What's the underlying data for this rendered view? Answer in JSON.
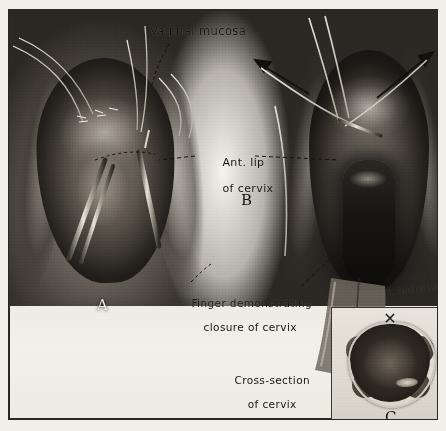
{
  "plate": {
    "title": "Surgical plate: vaginal cervix closure",
    "medium": "halftone photographic illustration",
    "border_color": "#2a2722",
    "paper_color": "#f2efe8"
  },
  "labels": {
    "vaginal_mucosa": "Vaginal mucosa",
    "ant_lip_line1": "Ant. lip",
    "ant_lip_line2": "of cervix",
    "finger_line1": "Finger demonstrating",
    "finger_line2": "closure of cervix",
    "cross_line1": "Cross-section",
    "cross_line2": "of cervix",
    "cross_line3": "demonstrating",
    "cross_line4": "ligature"
  },
  "panels": [
    {
      "letter": "A",
      "name": "panel-a",
      "description": "Left operative field with sutures and clamps"
    },
    {
      "letter": "B",
      "name": "panel-b",
      "description": "Right operative field with traction arrows and finger closure"
    },
    {
      "letter": "C",
      "name": "panel-c",
      "description": "Inset cross-section of cervix demonstrating ligature"
    }
  ],
  "signature": {
    "text": "R. Michelsen",
    "style": "cursive artist signature"
  },
  "icons": {
    "arrow_left": "arrow-up-left-icon",
    "arrow_right": "arrow-up-right-icon",
    "knot": "✕"
  },
  "colors": {
    "ink": "#16130f",
    "highlight": "#f2efe8",
    "tissue_dark": "#2e2922",
    "tissue_mid": "#6e6861",
    "suture": "#e7e2d6"
  }
}
